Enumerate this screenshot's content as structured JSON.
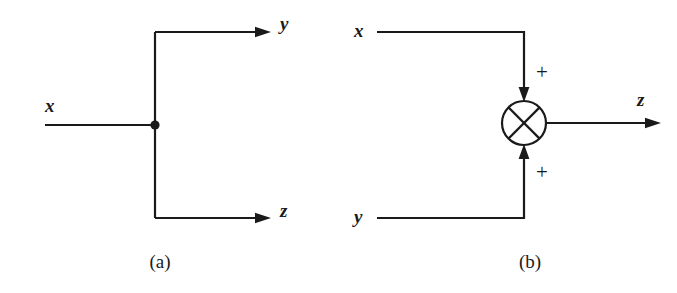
{
  "figure": {
    "width": 677,
    "height": 293,
    "background_color": "#ffffff",
    "stroke_color": "#1a1a1a"
  },
  "panel_a": {
    "caption": "(a)",
    "input_label": "x",
    "output_labels": {
      "top": "y",
      "bottom": "z"
    },
    "junction_dot_name": "signal-split-node"
  },
  "panel_b": {
    "caption": "(b)",
    "input_labels": {
      "top": "x",
      "bottom": "y"
    },
    "output_label": "z",
    "sign_top": "+",
    "sign_bottom": "+",
    "summing_junction_name": "summing-junction"
  }
}
